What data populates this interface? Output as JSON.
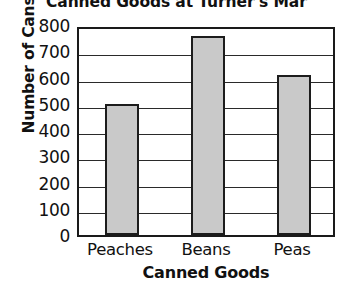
{
  "chart_data": {
    "type": "bar",
    "title": "Canned Goods at Turner's Mar",
    "xlabel": "Canned Goods",
    "ylabel": "Number of Cans",
    "categories": [
      "Peaches",
      "Beans",
      "Peas"
    ],
    "values": [
      500,
      760,
      610
    ],
    "ylim": [
      0,
      800
    ],
    "ytick_labels": [
      "800",
      "700",
      "600",
      "500",
      "400",
      "300",
      "200",
      "100",
      "0"
    ],
    "ytick_values": [
      800,
      700,
      600,
      500,
      400,
      300,
      200,
      100,
      0
    ],
    "grid": "horizontal",
    "legend": "none",
    "bar_fill_color": "#c9c9c9",
    "bar_border_color": "#1c1c1c",
    "axis_color": "#1a1a1a"
  }
}
